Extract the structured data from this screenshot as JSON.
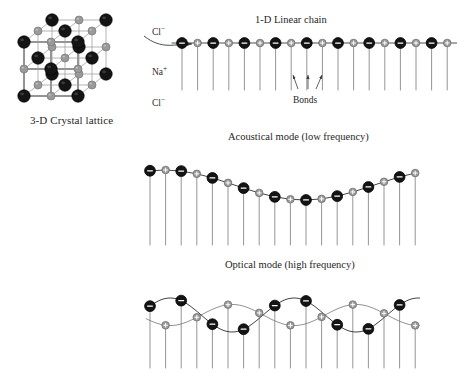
{
  "figure": {
    "background": "#ffffff",
    "ink": "#1a1a1a"
  },
  "colors": {
    "anion_fill": "#141414",
    "anion_stroke": "#000000",
    "cation_fill": "#9a9a9a",
    "cation_stroke": "#6e6e6e",
    "sign_color": "#ffffff",
    "bond_line": "#3a3a3a",
    "stem_line": "#7a7a7a",
    "lattice_dark_edge": "#2a2a2a",
    "lattice_light_edge": "#9c9c9c"
  },
  "crystal": {
    "caption": "3-D Crystal lattice",
    "labels": [
      {
        "id": "cl-top",
        "base": "Cl",
        "charge": "−",
        "x": 152,
        "y": 30
      },
      {
        "id": "na-mid",
        "base": "Na",
        "charge": "+",
        "x": 152,
        "y": 70
      },
      {
        "id": "cl-bottom",
        "base": "Cl",
        "charge": "−",
        "x": 152,
        "y": 101
      }
    ],
    "ion_symbols": {
      "anion": "−",
      "cation": "+"
    }
  },
  "callout": {
    "name": "extraction-arrow",
    "from": {
      "x": 150,
      "y": 44
    },
    "to": {
      "x": 196,
      "y": 44
    }
  },
  "chain": {
    "title": "1-D Linear chain",
    "bonds_label": "Bonds",
    "baseline_y": 43,
    "x_start": 182,
    "spacing": 15.6,
    "pair_count": 9,
    "stem_length": 47,
    "anion_r": 5.4,
    "cation_r": 3.8,
    "bond_arrows": [
      {
        "x1": 307,
        "y1": 90,
        "x2": 300,
        "y2": 76
      },
      {
        "x1": 314,
        "y1": 90,
        "x2": 314,
        "y2": 76
      },
      {
        "x1": 321,
        "y1": 90,
        "x2": 329,
        "y2": 76
      }
    ]
  },
  "acoustic": {
    "title": "Acoustical mode (low frequency)",
    "center_y": 185,
    "x_start": 150,
    "spacing": 15.6,
    "pair_count": 9,
    "amplitude": 15,
    "wavelength_px": 280,
    "phase": 1.25,
    "stem_bottom": 245,
    "anion_r": 5.4,
    "cation_r": 3.8,
    "description": "Both ion sublattices displace in phase along one common wave"
  },
  "optical": {
    "title": "Optical mode (high frequency)",
    "center_y": 315,
    "x_start": 150,
    "spacing": 15.6,
    "pair_count": 9,
    "amplitude": 17,
    "wavelength_px": 124,
    "phase": 0.55,
    "stem_bottom": 368,
    "anion_r": 5.4,
    "cation_r": 3.8,
    "description": "Anion and cation sublattices displace out of phase (opposite directions)"
  }
}
